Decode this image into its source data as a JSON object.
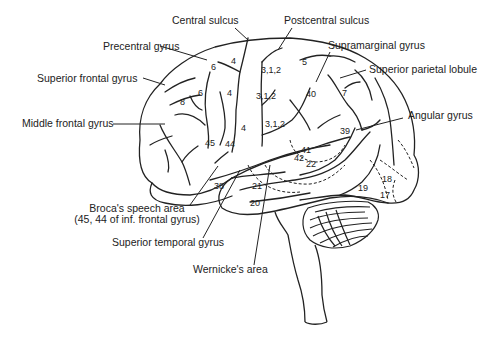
{
  "diagram": {
    "labels": {
      "central_sulcus": "Central sulcus",
      "postcentral_sulcus": "Postcentral sulcus",
      "precentral_gyrus": "Precentral gyrus",
      "supramarginal_gyrus": "Supramarginal gyrus",
      "superior_frontal_gyrus": "Superior frontal gyrus",
      "superior_parietal_lobule": "Superior parietal lobule",
      "angular_gyrus": "Angular gyrus",
      "middle_frontal_gyrus": "Middle frontal gyrus",
      "brocas_area_line1": "Broca's speech area",
      "brocas_area_line2": "(45, 44 of inf. frontal gyrus)",
      "superior_temporal_gyrus": "Superior temporal gyrus",
      "wernickes_area": "Wernicke's area"
    },
    "brodmann_areas": {
      "a4_top": "4",
      "a6_top": "6",
      "a312_top": "3,1,2",
      "a5": "5",
      "a6_mid": "6",
      "a4_mid": "4",
      "a8": "8",
      "a312_mid": "3,1,2",
      "a40": "40",
      "a7": "7",
      "a4_low": "4",
      "a312_low": "3,1,2",
      "a39": "39",
      "a45": "45",
      "a44": "44",
      "a41": "41",
      "a42": "42",
      "a22": "22",
      "a38": "38",
      "a21": "21",
      "a20": "20",
      "a18": "18",
      "a19": "19",
      "a17": "17"
    },
    "colors": {
      "ink": "#222222",
      "background": "#ffffff"
    }
  }
}
